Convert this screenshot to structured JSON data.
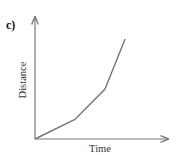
{
  "panel_label": "c)",
  "chart_data": {
    "type": "line",
    "title": "",
    "xlabel": "Time",
    "ylabel": "Distance",
    "grid": false,
    "legend": null,
    "axis_ticks": false,
    "series": [
      {
        "name": "distance-time",
        "points": [
          [
            0,
            0
          ],
          [
            1.33,
            0.16
          ],
          [
            2.33,
            0.41
          ],
          [
            3.0,
            0.82
          ]
        ]
      }
    ],
    "xlim": [
      0,
      4.43
    ],
    "ylim": [
      0,
      1.0
    ],
    "colors": {
      "axis": "#777777",
      "line": "#777777"
    }
  }
}
